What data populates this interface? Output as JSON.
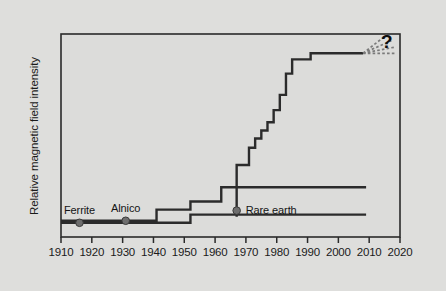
{
  "figure": {
    "background_color": "#dededc",
    "plot_background_color": "#dcdcda",
    "frame_color": "#2a2a2a",
    "curve_color": "#2b2b2b",
    "marker_color": "#6e6e6e",
    "dashed_color": "#7a7a7a",
    "question_mark": "?"
  },
  "chart_data": {
    "type": "line",
    "title": "",
    "subtitle": "",
    "xlabel": "",
    "ylabel": "Relative magnetic field intensity",
    "xlim": [
      1910,
      2020
    ],
    "ylim": [
      0,
      1
    ],
    "grid": false,
    "legend_position": "none",
    "x_tick_labels": [
      "1910",
      "1920",
      "1930",
      "1940",
      "1950",
      "1960",
      "1970",
      "1980",
      "1990",
      "2000",
      "2010",
      "2020"
    ],
    "x_ticks": [
      1910,
      1920,
      1930,
      1940,
      1950,
      1960,
      1970,
      1980,
      1990,
      2000,
      2010,
      2020
    ],
    "y_tick_labels": [],
    "note": "Step (staircase) curves showing relative magnetic field intensity of permanent magnet families vs year of introduction. Y axis is unlabeled/relative.",
    "series": [
      {
        "name": "Ferrite",
        "step_style": "post",
        "annotation": {
          "label": "Ferrite",
          "year": 1916,
          "value": 0.07,
          "marker": true
        },
        "points": [
          {
            "x": 1910,
            "y": 0.07
          },
          {
            "x": 1952,
            "y": 0.07
          },
          {
            "x": 1952,
            "y": 0.11
          },
          {
            "x": 2009,
            "y": 0.11
          }
        ]
      },
      {
        "name": "Alnico",
        "step_style": "post",
        "annotation": {
          "label": "Alnico",
          "year": 1931,
          "value": 0.08,
          "marker": true
        },
        "points": [
          {
            "x": 1910,
            "y": 0.08
          },
          {
            "x": 1941,
            "y": 0.08
          },
          {
            "x": 1941,
            "y": 0.135
          },
          {
            "x": 1952,
            "y": 0.135
          },
          {
            "x": 1952,
            "y": 0.175
          },
          {
            "x": 1962,
            "y": 0.175
          },
          {
            "x": 1962,
            "y": 0.245
          },
          {
            "x": 2009,
            "y": 0.245
          }
        ]
      },
      {
        "name": "Rare earth",
        "step_style": "post",
        "annotation": {
          "label": "Rare earth",
          "year": 1967,
          "value": 0.13,
          "marker": true
        },
        "points": [
          {
            "x": 1967,
            "y": 0.1
          },
          {
            "x": 1967,
            "y": 0.355
          },
          {
            "x": 1971,
            "y": 0.355
          },
          {
            "x": 1971,
            "y": 0.44
          },
          {
            "x": 1973,
            "y": 0.44
          },
          {
            "x": 1973,
            "y": 0.485
          },
          {
            "x": 1975,
            "y": 0.485
          },
          {
            "x": 1975,
            "y": 0.525
          },
          {
            "x": 1977,
            "y": 0.525
          },
          {
            "x": 1977,
            "y": 0.565
          },
          {
            "x": 1979,
            "y": 0.565
          },
          {
            "x": 1979,
            "y": 0.625
          },
          {
            "x": 1981,
            "y": 0.625
          },
          {
            "x": 1981,
            "y": 0.7
          },
          {
            "x": 1983,
            "y": 0.7
          },
          {
            "x": 1983,
            "y": 0.805
          },
          {
            "x": 1985,
            "y": 0.805
          },
          {
            "x": 1985,
            "y": 0.875
          },
          {
            "x": 1991,
            "y": 0.875
          },
          {
            "x": 1991,
            "y": 0.905
          },
          {
            "x": 2008,
            "y": 0.905
          }
        ]
      }
    ],
    "extrapolation": {
      "label": "?",
      "description": "Fan of dashed lines projecting uncertain future growth from the end of the rare-earth curve",
      "origin": {
        "x": 2008,
        "y": 0.905
      },
      "rays": [
        {
          "angle_deg": 38,
          "length": 30
        },
        {
          "angle_deg": 24,
          "length": 31
        },
        {
          "angle_deg": 11,
          "length": 32
        },
        {
          "angle_deg": 0,
          "length": 33
        }
      ]
    }
  }
}
